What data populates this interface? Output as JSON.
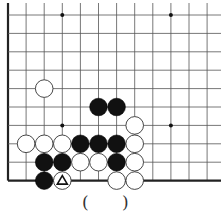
{
  "diagram": {
    "type": "go-board-partial",
    "grid": {
      "origin_x": 8,
      "origin_y": 15,
      "spacing_x": 18.1,
      "spacing_y": 18.4,
      "cols": 12,
      "rows": 10,
      "left_edge": true,
      "bottom_edge": true
    },
    "hoshi": [
      [
        3,
        0
      ],
      [
        9,
        0
      ],
      [
        3,
        6
      ],
      [
        9,
        6
      ]
    ],
    "stones": [
      {
        "color": "white",
        "col": 2,
        "row": 4
      },
      {
        "color": "black",
        "col": 5,
        "row": 5
      },
      {
        "color": "black",
        "col": 6,
        "row": 5
      },
      {
        "color": "white",
        "col": 7,
        "row": 6
      },
      {
        "color": "white",
        "col": 1,
        "row": 7
      },
      {
        "color": "white",
        "col": 2,
        "row": 7
      },
      {
        "color": "white",
        "col": 3,
        "row": 7
      },
      {
        "color": "black",
        "col": 4,
        "row": 7
      },
      {
        "color": "black",
        "col": 5,
        "row": 7
      },
      {
        "color": "black",
        "col": 6,
        "row": 7
      },
      {
        "color": "white",
        "col": 7,
        "row": 7
      },
      {
        "color": "black",
        "col": 2,
        "row": 8
      },
      {
        "color": "black",
        "col": 3,
        "row": 8
      },
      {
        "color": "white",
        "col": 4,
        "row": 8
      },
      {
        "color": "white",
        "col": 5,
        "row": 8
      },
      {
        "color": "black",
        "col": 6,
        "row": 8
      },
      {
        "color": "white",
        "col": 7,
        "row": 8
      },
      {
        "color": "black",
        "col": 2,
        "row": 9
      },
      {
        "color": "white",
        "col": 3,
        "row": 9,
        "mark": "triangle"
      },
      {
        "color": "white",
        "col": 6,
        "row": 9
      },
      {
        "color": "white",
        "col": 7,
        "row": 9
      }
    ],
    "colors": {
      "line": "#555555",
      "black_stone": "#111111",
      "white_stone": "#ffffff",
      "edge": "#222222"
    }
  },
  "answer": {
    "open_paren": "(",
    "close_paren": ")"
  }
}
